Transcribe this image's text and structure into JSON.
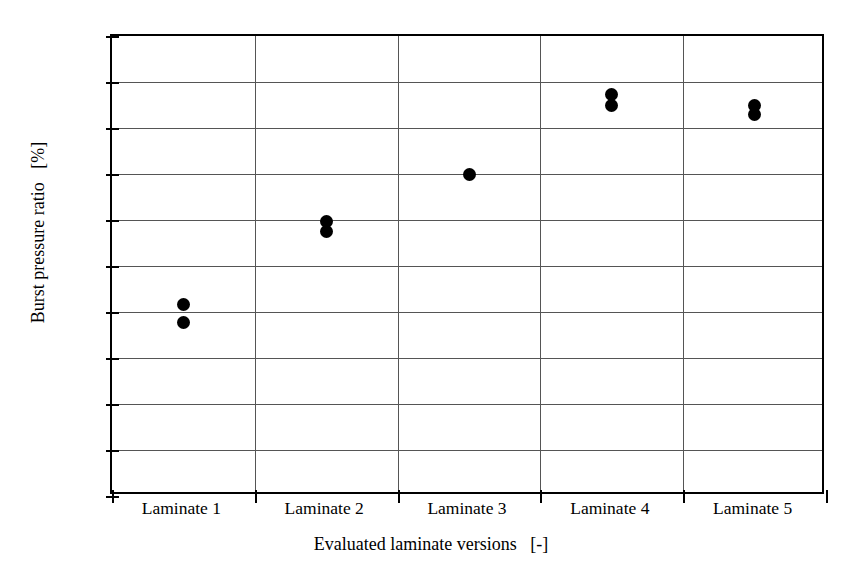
{
  "chart_data": {
    "type": "scatter",
    "title": "",
    "xlabel": "Evaluated laminate versions   [-]",
    "ylabel": "Burst pressure ratio   [%]",
    "categories": [
      "Laminate 1",
      "Laminate 2",
      "Laminate 3",
      "Laminate 4",
      "Laminate 5"
    ],
    "ylim": [
      80,
      130
    ],
    "yticks": [
      80,
      85,
      90,
      95,
      100,
      105,
      110,
      115,
      120,
      125,
      130
    ],
    "ytick_labels": [
      "80",
      "85",
      "90",
      "95",
      "100",
      "105",
      "110",
      "115",
      "120",
      "125",
      "130"
    ],
    "grid": true,
    "legend": null,
    "marker": "filled-circle",
    "marker_color": "#000000",
    "series": [
      {
        "name": "Burst pressure ratio",
        "points": [
          {
            "category": "Laminate 1",
            "x": 1,
            "values": [
              100.8,
              98.9
            ]
          },
          {
            "category": "Laminate 2",
            "x": 2,
            "values": [
              109.8,
              108.8
            ]
          },
          {
            "category": "Laminate 3",
            "x": 3,
            "values": [
              114.9
            ]
          },
          {
            "category": "Laminate 4",
            "x": 4,
            "values": [
              123.6,
              122.4
            ]
          },
          {
            "category": "Laminate 5",
            "x": 5,
            "values": [
              122.5,
              121.5
            ]
          }
        ]
      }
    ]
  },
  "style": {
    "axis_color": "#000000",
    "grid_color": "#555555",
    "background": "#ffffff"
  }
}
